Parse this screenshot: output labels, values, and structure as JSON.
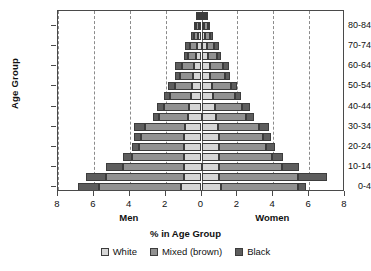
{
  "chart_data": {
    "type": "bar",
    "subtype": "population-pyramid-stacked",
    "title": "",
    "xlabel": "% in Age Group",
    "ylabel": "Age Group",
    "xlim": [
      -8,
      8
    ],
    "xticks": [
      8,
      6,
      4,
      2,
      0,
      2,
      4,
      6,
      8
    ],
    "xtick_values": [
      -8,
      -6,
      -4,
      -2,
      0,
      2,
      4,
      6,
      8
    ],
    "grid": true,
    "grid_axis": "x",
    "legend_position": "bottom",
    "side_labels": {
      "left": "Men",
      "right": "Women"
    },
    "categories": [
      "0-4",
      "5-9",
      "10-14",
      "15-19",
      "20-24",
      "25-29",
      "30-34",
      "35-39",
      "40-44",
      "45-49",
      "50-54",
      "55-59",
      "60-64",
      "65-69",
      "70-74",
      "75-79",
      "80-84",
      "85+"
    ],
    "ytick_labels": [
      "0-4",
      "10-14",
      "20-24",
      "30-34",
      "40-44",
      "50-54",
      "60-64",
      "70-74",
      "80-84"
    ],
    "series": [
      {
        "name": "White",
        "color": "#d6d6d6"
      },
      {
        "name": "Mixed (brown)",
        "color": "#919191"
      },
      {
        "name": "Black",
        "color": "#5d5d5d"
      }
    ],
    "men": {
      "White": [
        1.15,
        0.95,
        1.0,
        0.95,
        0.95,
        0.95,
        0.9,
        0.75,
        0.7,
        0.6,
        0.55,
        0.45,
        0.4,
        0.3,
        0.25,
        0.18,
        0.12,
        0.1
      ],
      "Mixed (brown)": [
        4.55,
        4.4,
        3.4,
        2.9,
        2.55,
        2.4,
        2.25,
        1.6,
        1.4,
        1.15,
        0.95,
        0.75,
        0.7,
        0.45,
        0.4,
        0.25,
        0.18,
        0.12
      ],
      "Black": [
        1.2,
        1.1,
        0.95,
        0.55,
        0.4,
        0.4,
        0.6,
        0.35,
        0.4,
        0.35,
        0.35,
        0.3,
        0.4,
        0.22,
        0.25,
        0.15,
        0.12,
        0.1
      ]
    },
    "women": {
      "White": [
        1.1,
        0.95,
        1.0,
        0.95,
        0.95,
        0.95,
        0.9,
        0.8,
        0.75,
        0.65,
        0.6,
        0.5,
        0.45,
        0.35,
        0.3,
        0.22,
        0.15,
        0.12
      ],
      "Mixed (brown)": [
        4.3,
        4.45,
        3.5,
        3.0,
        2.65,
        2.5,
        2.3,
        1.7,
        1.5,
        1.2,
        1.05,
        0.8,
        0.75,
        0.5,
        0.42,
        0.28,
        0.2,
        0.14
      ],
      "Black": [
        0.45,
        1.6,
        0.95,
        0.6,
        0.5,
        0.45,
        0.55,
        0.4,
        0.45,
        0.35,
        0.35,
        0.3,
        0.35,
        0.22,
        0.25,
        0.15,
        0.12,
        0.1
      ]
    }
  }
}
